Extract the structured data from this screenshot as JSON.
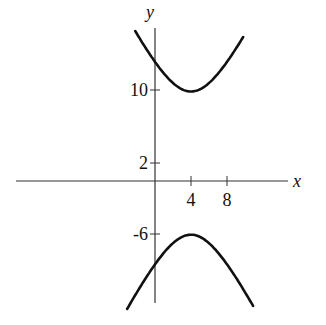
{
  "chart_data": {
    "type": "line",
    "title": "",
    "xlabel": "x",
    "ylabel": "y",
    "equation": "(y-2)^2/64 - (x-4)^2/16 = 1",
    "center": [
      4,
      2
    ],
    "vertices": [
      [
        4,
        10
      ],
      [
        4,
        -6
      ]
    ],
    "x_ticks": [
      4,
      8
    ],
    "y_ticks": [
      10,
      2,
      -6
    ],
    "xlim": [
      -17,
      16
    ],
    "ylim": [
      -13.4,
      19.7
    ],
    "grid": false,
    "legend": null,
    "series": [
      {
        "name": "upper branch",
        "x_range": [
          -2.2,
          9.8
        ],
        "sign": 1
      },
      {
        "name": "lower branch",
        "x_range": [
          -3.1,
          10.9
        ],
        "sign": -1
      }
    ]
  },
  "labels": {
    "x_axis": "x",
    "y_axis": "y",
    "tick_x_4": "4",
    "tick_x_8": "8",
    "tick_y_10": "10",
    "tick_y_2": "2",
    "tick_y_neg6": "-6"
  }
}
